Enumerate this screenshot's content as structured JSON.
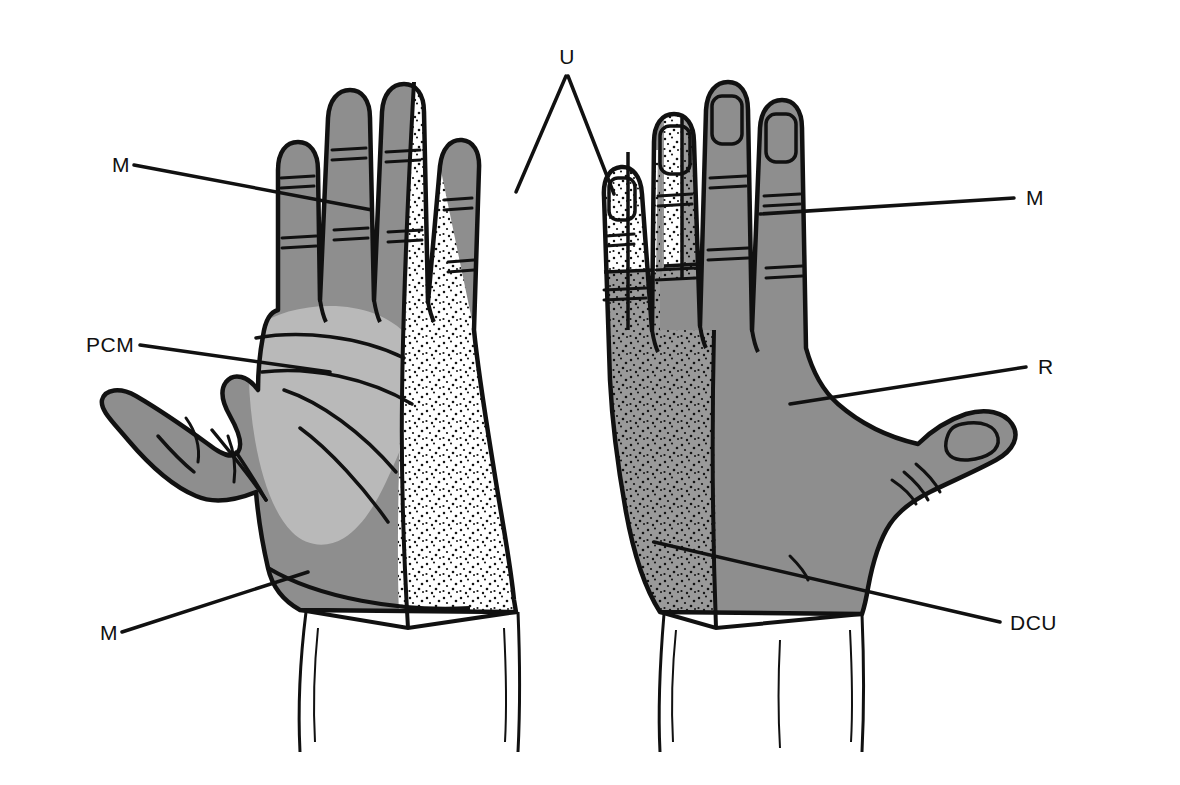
{
  "figure": {
    "views": [
      {
        "name": "palmar-view",
        "side": "left",
        "description": "Palmar (volar) surface of the hand"
      },
      {
        "name": "dorsal-view",
        "side": "right",
        "description": "Dorsal surface of the hand"
      }
    ]
  },
  "frame": {
    "color": "#c9c9c9"
  },
  "labels": [
    {
      "key": "m_left_top",
      "text": "M",
      "x": 112,
      "y": 172,
      "anchor": "start",
      "name": "label-median-left-top"
    },
    {
      "key": "pcm_left",
      "text": "PCM",
      "x": 86,
      "y": 352,
      "anchor": "start",
      "name": "label-pcm-left"
    },
    {
      "key": "m_left_bottom",
      "text": "M",
      "x": 100,
      "y": 640,
      "anchor": "start",
      "name": "label-median-left-bottom"
    },
    {
      "key": "u_top",
      "text": "U",
      "x": 567,
      "y": 64,
      "anchor": "middle",
      "name": "label-ulnar-top"
    },
    {
      "key": "m_right",
      "text": "M",
      "x": 1026,
      "y": 205,
      "anchor": "start",
      "name": "label-median-right"
    },
    {
      "key": "r_right",
      "text": "R",
      "x": 1038,
      "y": 374,
      "anchor": "start",
      "name": "label-radial-right"
    },
    {
      "key": "dcu_right",
      "text": "DCU",
      "x": 1010,
      "y": 630,
      "anchor": "start",
      "name": "label-dcu-right"
    }
  ],
  "legend_meaning": {
    "M": "Median nerve",
    "U": "Ulnar nerve",
    "R": "Radial nerve",
    "PCM": "Palmar cutaneous branch of the median nerve",
    "DCU": "Dorsal cutaneous branch of the ulnar nerve"
  },
  "colors": {
    "median_gray": "#8e8e8e",
    "radial_gray": "#8e8e8e",
    "pcm_light_gray": "#b9b9b9",
    "ulnar_stipple_bg": "#ffffff",
    "dcu_stipple_bg": "#9a9a9a",
    "outline": "#111111",
    "frame": "#c9c9c9",
    "page_background": "#ffffff"
  },
  "regions": [
    {
      "name": "left-hand-median-territory",
      "view": "palmar",
      "nerve": "M",
      "fill": "solid-gray"
    },
    {
      "name": "left-hand-pcm-territory",
      "view": "palmar",
      "nerve": "PCM",
      "fill": "light-gray"
    },
    {
      "name": "left-hand-ulnar-territory",
      "view": "palmar",
      "nerve": "U",
      "fill": "stipple-on-white"
    },
    {
      "name": "left-hand-thumb-median",
      "view": "palmar",
      "nerve": "M",
      "fill": "solid-gray"
    },
    {
      "name": "right-hand-radial-territory",
      "view": "dorsal",
      "nerve": "R",
      "fill": "solid-gray"
    },
    {
      "name": "right-hand-median-fingertips",
      "view": "dorsal",
      "nerve": "M",
      "fill": "solid-gray"
    },
    {
      "name": "right-hand-dcu-territory",
      "view": "dorsal",
      "nerve": "DCU",
      "fill": "stipple-on-gray"
    },
    {
      "name": "right-hand-ulnar-fingertips",
      "view": "dorsal",
      "nerve": "U",
      "fill": "stipple-on-white"
    }
  ]
}
